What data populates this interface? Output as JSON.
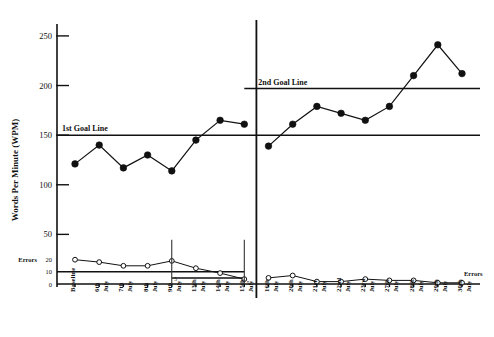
{
  "chart_data": {
    "type": "line",
    "title": "",
    "xlabel": "",
    "ylabel": "Words Per Minute (WPM)",
    "ylim": [
      0,
      262
    ],
    "y_ticks": [
      50,
      100,
      150,
      200,
      250
    ],
    "secondary_axis": {
      "label": "Errors",
      "label_right": "Errors",
      "ticks": [
        0,
        10,
        20
      ],
      "lim": [
        0,
        28
      ]
    },
    "grid": false,
    "legend_position": "none",
    "categories": [
      "Baseline",
      "6th",
      "7th",
      "8th",
      "9th",
      "13th",
      "14th",
      "15th",
      "16th",
      "20th",
      "21st",
      "22nd",
      "23rd",
      "27th",
      "28th",
      "29th",
      "30th"
    ],
    "category_sub": [
      "",
      "July",
      "July",
      "July",
      "July",
      "July",
      "July",
      "July",
      "July",
      "July",
      "July",
      "July",
      "July",
      "July",
      "July",
      "July",
      "July"
    ],
    "series": [
      {
        "name": "Words Per Minute",
        "marker": "filled-circle",
        "axis": "left",
        "values": [
          121,
          140,
          117,
          130,
          114,
          145,
          165,
          161,
          139,
          161,
          179,
          172,
          165,
          179,
          210,
          241,
          212
        ]
      },
      {
        "name": "Errors",
        "marker": "open-circle",
        "axis": "right",
        "values": [
          20,
          18,
          15,
          15,
          19,
          13,
          9,
          4,
          5,
          7,
          2,
          2,
          4,
          3,
          3,
          1,
          1
        ]
      }
    ],
    "reference_lines": [
      {
        "name": "1st Goal Line",
        "label": "1st Goal Line",
        "value": 150,
        "axis": "left",
        "x_start_index": 0,
        "x_end_index": 16
      },
      {
        "name": "2nd Goal Line",
        "label": "2nd Goal Line",
        "value": 197,
        "axis": "left",
        "x_start_index": 7,
        "x_end_index": 16
      },
      {
        "name": "errors-goal-line",
        "label": "",
        "value": 10,
        "axis": "right",
        "x_start_index": 0,
        "x_end_index": 7
      },
      {
        "name": "errors-goal-line-2",
        "label": "5",
        "value": 5,
        "axis": "right",
        "x_start_index": 4,
        "x_end_index": 7
      }
    ],
    "phase_lines": [
      {
        "name": "phase-change-line",
        "after_index": 7
      }
    ],
    "annotations": [
      {
        "name": "errors-criterion-5-first",
        "text": "5",
        "x_index": 4,
        "axis": "right",
        "value": 5
      },
      {
        "name": "errors-criterion-5-second",
        "text": "5",
        "x_index": 7,
        "axis": "right",
        "value": 2
      }
    ]
  },
  "axis": {
    "y_label": "Words Per Minute (WPM)",
    "errors_label_left": "Errors",
    "errors_label_right": "Errors",
    "ticks": {
      "t250": "250",
      "t200": "200",
      "t150": "150",
      "t100": "100",
      "t50": "50",
      "e20": "20",
      "e10": "10",
      "e0": "0"
    }
  },
  "labels": {
    "goal1": "1st Goal Line",
    "goal2": "2nd Goal Line",
    "mini5_a": "5",
    "mini5_b": "5"
  }
}
